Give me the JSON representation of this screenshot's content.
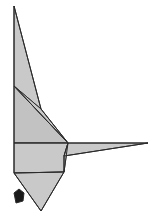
{
  "canvas": {
    "width": 153,
    "height": 222,
    "background": "#ffffff",
    "title": "Low-poly origami figure"
  },
  "style": {
    "fill_light": "#c9c9c9",
    "fill_mid": "#c2c2c2",
    "fill_dark": "#1a1a1a",
    "stroke": "#2b2b2b",
    "stroke_width": 1
  },
  "chart_data": {
    "type": "scatter",
    "xlabel": "",
    "ylabel": "",
    "xlim": [
      0,
      153
    ],
    "ylim": [
      0,
      222
    ],
    "grid": false,
    "legend": "none",
    "shapes": [
      {
        "name": "upper-spike",
        "fill": "#c9c9c9",
        "points": "14,6 14,86 41,109"
      },
      {
        "name": "upper-body-wedge",
        "fill": "#c2c2c2",
        "points": "14,86 68,143 14,143"
      },
      {
        "name": "mid-body-panel",
        "fill": "#c9c9c9",
        "points": "14,86 41,109 68,143"
      },
      {
        "name": "lower-body-panel",
        "fill": "#c9c9c9",
        "points": "14,143 68,143 64,172 14,173"
      },
      {
        "name": "right-wing-upper",
        "fill": "#c9c9c9",
        "points": "68,143 148,143 64,156"
      },
      {
        "name": "right-wing-lower",
        "fill": "#c2c2c2",
        "points": "68,143 64,156 64,172"
      },
      {
        "name": "lower-tail-triangle",
        "fill": "#c9c9c9",
        "points": "14,173 64,172 41,211"
      },
      {
        "name": "dark-marker",
        "fill": "#1a1a1a",
        "points": "14,193 19,189 24,193 23,201 16,203"
      }
    ],
    "edges": [
      {
        "name": "left-vertical-edge",
        "from": [
          14,
          6
        ],
        "to": [
          14,
          173
        ]
      },
      {
        "name": "spike-right-edge",
        "from": [
          14,
          6
        ],
        "to": [
          41,
          109
        ]
      },
      {
        "name": "spike-to-junction",
        "from": [
          41,
          109
        ],
        "to": [
          68,
          143
        ]
      },
      {
        "name": "upper-diagonal",
        "from": [
          14,
          86
        ],
        "to": [
          68,
          143
        ]
      },
      {
        "name": "horizontal-midline",
        "from": [
          14,
          143
        ],
        "to": [
          148,
          143
        ]
      },
      {
        "name": "wing-lower-edge",
        "from": [
          64,
          156
        ],
        "to": [
          148,
          143
        ]
      },
      {
        "name": "junction-to-wingnotch",
        "from": [
          68,
          143
        ],
        "to": [
          64,
          156
        ]
      },
      {
        "name": "wingnotch-down",
        "from": [
          64,
          156
        ],
        "to": [
          64,
          172
        ]
      },
      {
        "name": "lower-panel-edge",
        "from": [
          14,
          173
        ],
        "to": [
          64,
          172
        ]
      },
      {
        "name": "tail-left-edge",
        "from": [
          14,
          173
        ],
        "to": [
          41,
          211
        ]
      },
      {
        "name": "tail-right-edge",
        "from": [
          64,
          172
        ],
        "to": [
          41,
          211
        ]
      }
    ]
  }
}
